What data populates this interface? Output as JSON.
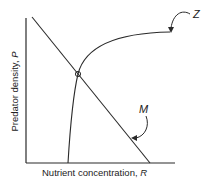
{
  "diagram": {
    "x_axis_label": "Nutrient concentration, ",
    "x_axis_var": "R",
    "y_axis_label": "Predator density, ",
    "y_axis_var": "P",
    "curves": [
      {
        "id": "Z",
        "label": "Z",
        "description": "saturating isocline rising from R-axis and leveling off"
      },
      {
        "id": "M",
        "label": "M",
        "description": "straight decreasing line"
      }
    ],
    "equilibrium_point": "intersection of Z and M",
    "colors": {
      "line": "#2a2a2a",
      "background": "#ffffff"
    }
  }
}
